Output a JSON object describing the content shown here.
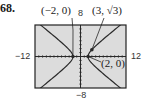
{
  "problem_number": "68.",
  "chart_data": {
    "type": "line",
    "title": "",
    "xlabel": "",
    "ylabel": "",
    "xlim": [
      -12,
      12
    ],
    "ylim": [
      -8,
      8
    ],
    "x_tick_labels": {
      "left": "−12",
      "right": "12"
    },
    "y_tick_labels": {
      "top": "8",
      "bottom": "−8"
    },
    "grid": false,
    "axes_ticks_every": 1,
    "series": [
      {
        "name": "hyperbola right branch",
        "equation": "x^2/4 - y^2/2.4 = 1",
        "vertex": [
          2,
          0
        ]
      },
      {
        "name": "hyperbola left branch",
        "equation": "x^2/4 - y^2/2.4 = 1",
        "vertex": [
          -2,
          0
        ]
      }
    ],
    "annotations": [
      {
        "text": "(−2, 0)",
        "point": [
          -2,
          0
        ]
      },
      {
        "text": "(3, √3)",
        "point": [
          3,
          1.732
        ]
      },
      {
        "text": "(2, 0)",
        "point": [
          2,
          0
        ]
      }
    ]
  },
  "labels": {
    "left_vertex": "(−2, 0)",
    "point": "(3, √3)",
    "right_vertex": "(2, 0)",
    "xmin": "−12",
    "xmax": "12",
    "ymax": "8",
    "ymin": "−8"
  },
  "colors": {
    "plot_bg": "#dcdcdc",
    "curve": "#2a2a2a",
    "frame": "#222222"
  }
}
